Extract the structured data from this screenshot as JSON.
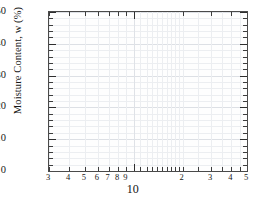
{
  "chart_data": {
    "type": "line",
    "title": "",
    "subtitle": "",
    "xlabel": "10",
    "ylabel": "Moisture Content, w (%)",
    "xscale": "log",
    "yscale": "linear",
    "xlim": [
      3,
      50
    ],
    "ylim": [
      0,
      50
    ],
    "grid": true,
    "legend": null,
    "series": [],
    "annotations": [],
    "note": "Empty semi-logarithmic plot template; no data series are drawn in the axes.",
    "y_axis": {
      "label": "Moisture Content, w (%)",
      "min": 0,
      "max": 50,
      "major_ticks": [
        0,
        10,
        20,
        30,
        40,
        50
      ],
      "tick_labels": [
        "0",
        "10",
        "20",
        "30",
        "40",
        "50"
      ],
      "minor_tick_step": 2
    },
    "x_axis": {
      "scale": "log",
      "min": 3,
      "max": 50,
      "decade_label": "10",
      "tick_values": [
        3,
        4,
        5,
        6,
        7,
        8,
        9,
        10,
        20,
        30,
        40,
        50
      ],
      "tick_labels": [
        "3",
        "4",
        "5",
        "6",
        "7",
        "8",
        "9",
        "",
        "2",
        "3",
        "4",
        "5"
      ],
      "minor_tick_values": [
        11,
        12,
        13,
        14,
        15,
        16,
        17,
        18,
        19,
        25,
        35,
        45
      ]
    },
    "colors": {
      "frame": "#4a4a4a",
      "grid": "#eceef1",
      "grid_major": "#dde0e5",
      "text": "#161616",
      "background": "#ffffff"
    }
  }
}
